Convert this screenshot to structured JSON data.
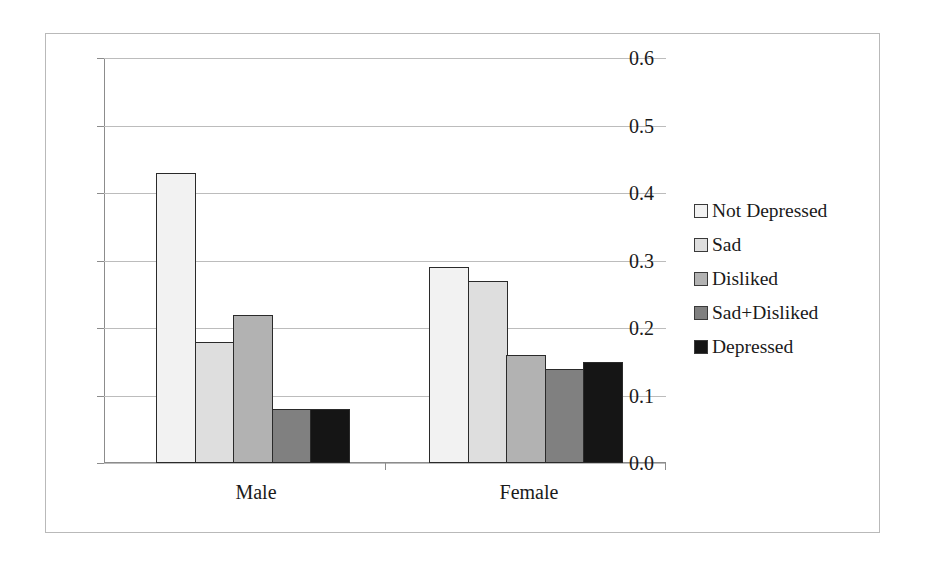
{
  "chart_data": {
    "type": "bar",
    "title": "",
    "subtitle": "",
    "xlabel": "",
    "ylabel": "",
    "categories": [
      "Male",
      "Female"
    ],
    "series": [
      {
        "name": "Not Depressed",
        "values": [
          0.43,
          0.29
        ],
        "color": "#f2f2f2"
      },
      {
        "name": "Sad",
        "values": [
          0.18,
          0.27
        ],
        "color": "#dedede"
      },
      {
        "name": "Disliked",
        "values": [
          0.22,
          0.16
        ],
        "color": "#b2b2b2"
      },
      {
        "name": "Sad+Disliked",
        "values": [
          0.08,
          0.14
        ],
        "color": "#808080"
      },
      {
        "name": "Depressed",
        "values": [
          0.08,
          0.15
        ],
        "color": "#151515"
      }
    ],
    "ylim": [
      0.0,
      0.6
    ],
    "ytick_values": [
      0.0,
      0.1,
      0.2,
      0.3,
      0.4,
      0.5,
      0.6
    ],
    "ytick_labels": [
      "0.0",
      "0.1",
      "0.2",
      "0.3",
      "0.4",
      "0.5",
      "0.6"
    ],
    "grid": true,
    "grid_axis": "y",
    "legend_position": "right",
    "bar_border_color": "#2a2a2a",
    "grid_color": "#bcbcbc",
    "axis_color": "#8c8c8c",
    "figure_border_color": "#b9b9b9",
    "background_color": "#ffffff"
  },
  "axis": {
    "y_ticks": [
      {
        "label": "0.6",
        "value": 0.6
      },
      {
        "label": "0.5",
        "value": 0.5
      },
      {
        "label": "0.4",
        "value": 0.4
      },
      {
        "label": "0.3",
        "value": 0.3
      },
      {
        "label": "0.2",
        "value": 0.2
      },
      {
        "label": "0.1",
        "value": 0.1
      },
      {
        "label": "0.0",
        "value": 0.0
      }
    ],
    "x_categories": [
      {
        "label": "Male"
      },
      {
        "label": "Female"
      }
    ]
  },
  "legend": {
    "items": [
      {
        "label": "Not Depressed",
        "color": "#f2f2f2"
      },
      {
        "label": "Sad",
        "color": "#dedede"
      },
      {
        "label": "Disliked",
        "color": "#b2b2b2"
      },
      {
        "label": "Sad+Disliked",
        "color": "#808080"
      },
      {
        "label": "Depressed",
        "color": "#151515"
      }
    ]
  }
}
